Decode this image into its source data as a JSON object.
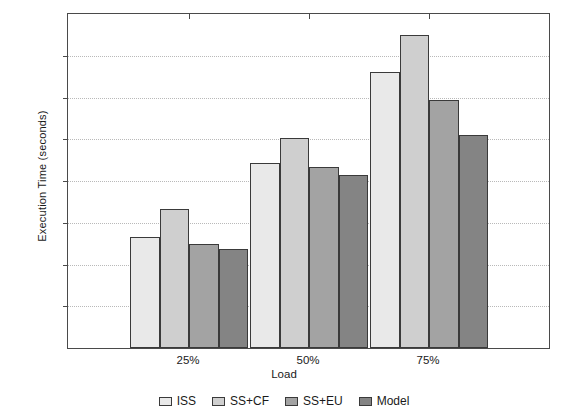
{
  "chart_data": {
    "type": "bar",
    "title": "",
    "xlabel": "Load",
    "ylabel": "Execution Time (seconds)",
    "categories": [
      "25%",
      "50%",
      "75%"
    ],
    "ylim": [
      0,
      160
    ],
    "yticks": [
      0,
      20,
      40,
      60,
      80,
      100,
      120,
      140,
      160
    ],
    "ytick_labels": [
      "0",
      "20",
      "40",
      "60",
      "80",
      "100",
      "120",
      "140",
      "160"
    ],
    "grid": true,
    "legend_position": "bottom",
    "series": [
      {
        "name": "ISS",
        "color": "#e9e9e9",
        "values": [
          53,
          88.5,
          132
        ]
      },
      {
        "name": "SS+CF",
        "color": "#cfcfcf",
        "values": [
          66.5,
          100.5,
          150
        ]
      },
      {
        "name": "SS+EU",
        "color": "#a3a3a3",
        "values": [
          50,
          86.5,
          119
        ]
      },
      {
        "name": "Model",
        "color": "#848484",
        "values": [
          47.5,
          83,
          102
        ]
      }
    ]
  }
}
